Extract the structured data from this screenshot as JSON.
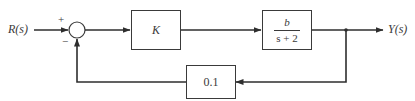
{
  "diagram": {
    "type": "feedback-control-block-diagram",
    "input_label": "R(s)",
    "output_label": "Y(s)",
    "summing_junction": {
      "plus_sign": "+",
      "minus_sign": "−"
    },
    "blocks": {
      "controller": {
        "label": "K"
      },
      "plant": {
        "numerator": "b",
        "denominator": "s + 2"
      },
      "feedback": {
        "label": "0.1"
      }
    },
    "colors": {
      "line": "#3a3a3a",
      "background": "#ffffff"
    }
  }
}
